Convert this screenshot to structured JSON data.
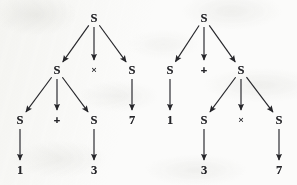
{
  "figure": {
    "name": "parse-trees-ambiguous-expression",
    "background_color": "#fbfbfa",
    "ink_color": "#26262a",
    "width": 297,
    "height": 185,
    "trees": [
      {
        "id": "left-tree",
        "reading": "(1 + 3) x 7",
        "nodes": [
          {
            "id": "L-root",
            "label": "S",
            "kind": "nonterminal",
            "x": 94,
            "y": 18
          },
          {
            "id": "L-l1-a",
            "label": "S",
            "kind": "nonterminal",
            "x": 57,
            "y": 70
          },
          {
            "id": "L-l1-op",
            "label": "×",
            "kind": "operator",
            "x": 94,
            "y": 70
          },
          {
            "id": "L-l1-b",
            "label": "S",
            "kind": "nonterminal",
            "x": 132,
            "y": 70
          },
          {
            "id": "L-l2-a",
            "label": "S",
            "kind": "nonterminal",
            "x": 20,
            "y": 120
          },
          {
            "id": "L-l2-op",
            "label": "+",
            "kind": "operator",
            "x": 57,
            "y": 120
          },
          {
            "id": "L-l2-b",
            "label": "S",
            "kind": "nonterminal",
            "x": 94,
            "y": 120
          },
          {
            "id": "L-num-7",
            "label": "7",
            "kind": "number",
            "x": 132,
            "y": 120
          },
          {
            "id": "L-num-1",
            "label": "1",
            "kind": "number",
            "x": 20,
            "y": 170
          },
          {
            "id": "L-num-3",
            "label": "3",
            "kind": "number",
            "x": 94,
            "y": 170
          }
        ],
        "edges": [
          {
            "id": "L-e1",
            "from": "L-root",
            "to": "L-l1-a"
          },
          {
            "id": "L-e2",
            "from": "L-root",
            "to": "L-l1-op"
          },
          {
            "id": "L-e3",
            "from": "L-root",
            "to": "L-l1-b"
          },
          {
            "id": "L-e4",
            "from": "L-l1-a",
            "to": "L-l2-a"
          },
          {
            "id": "L-e5",
            "from": "L-l1-a",
            "to": "L-l2-op"
          },
          {
            "id": "L-e6",
            "from": "L-l1-a",
            "to": "L-l2-b"
          },
          {
            "id": "L-e7",
            "from": "L-l1-b",
            "to": "L-num-7"
          },
          {
            "id": "L-e8",
            "from": "L-l2-a",
            "to": "L-num-1"
          },
          {
            "id": "L-e9",
            "from": "L-l2-b",
            "to": "L-num-3"
          }
        ]
      },
      {
        "id": "right-tree",
        "reading": "1 + (3 x 7)",
        "nodes": [
          {
            "id": "R-root",
            "label": "S",
            "kind": "nonterminal",
            "x": 204,
            "y": 18
          },
          {
            "id": "R-l1-a",
            "label": "S",
            "kind": "nonterminal",
            "x": 170,
            "y": 70
          },
          {
            "id": "R-l1-op",
            "label": "+",
            "kind": "operator",
            "x": 204,
            "y": 70
          },
          {
            "id": "R-l1-b",
            "label": "S",
            "kind": "nonterminal",
            "x": 241,
            "y": 70
          },
          {
            "id": "R-num-1",
            "label": "1",
            "kind": "number",
            "x": 170,
            "y": 120
          },
          {
            "id": "R-l2-a",
            "label": "S",
            "kind": "nonterminal",
            "x": 204,
            "y": 120
          },
          {
            "id": "R-l2-op",
            "label": "×",
            "kind": "operator",
            "x": 241,
            "y": 120
          },
          {
            "id": "R-l2-b",
            "label": "S",
            "kind": "nonterminal",
            "x": 279,
            "y": 120
          },
          {
            "id": "R-num-3",
            "label": "3",
            "kind": "number",
            "x": 204,
            "y": 170
          },
          {
            "id": "R-num-7",
            "label": "7",
            "kind": "number",
            "x": 279,
            "y": 170
          }
        ],
        "edges": [
          {
            "id": "R-e1",
            "from": "R-root",
            "to": "R-l1-a"
          },
          {
            "id": "R-e2",
            "from": "R-root",
            "to": "R-l1-op"
          },
          {
            "id": "R-e3",
            "from": "R-root",
            "to": "R-l1-b"
          },
          {
            "id": "R-e4",
            "from": "R-l1-a",
            "to": "R-num-1"
          },
          {
            "id": "R-e5",
            "from": "R-l1-b",
            "to": "R-l2-a"
          },
          {
            "id": "R-e6",
            "from": "R-l1-b",
            "to": "R-l2-op"
          },
          {
            "id": "R-e7",
            "from": "R-l1-b",
            "to": "R-l2-b"
          },
          {
            "id": "R-e8",
            "from": "R-l2-a",
            "to": "R-num-3"
          },
          {
            "id": "R-e9",
            "from": "R-l2-b",
            "to": "R-num-7"
          }
        ]
      }
    ]
  }
}
